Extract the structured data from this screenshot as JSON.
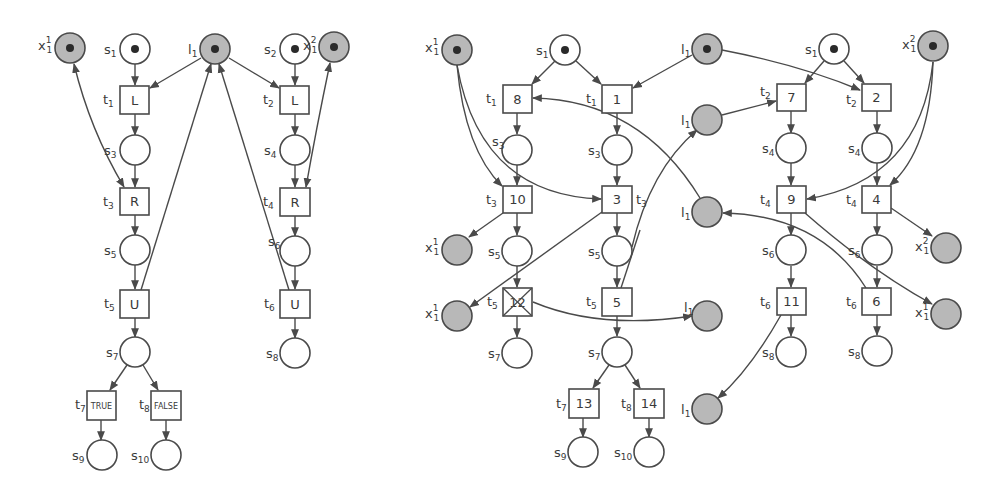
{
  "diagram": {
    "type": "petri-net-pair",
    "left_net": {
      "places": [
        {
          "id": "x1_1",
          "label": "x",
          "sup": "1",
          "sub": "1",
          "shared": true,
          "token": true
        },
        {
          "id": "s1",
          "label": "s",
          "sub": "1",
          "token": true
        },
        {
          "id": "l1",
          "label": "l",
          "sub": "1",
          "shared": true,
          "token": true
        },
        {
          "id": "s2",
          "label": "s",
          "sub": "2",
          "token": true
        },
        {
          "id": "x1_2",
          "label": "x",
          "sup": "2",
          "sub": "1",
          "shared": true,
          "token": true
        },
        {
          "id": "s3",
          "label": "s",
          "sub": "3"
        },
        {
          "id": "s4",
          "label": "s",
          "sub": "4"
        },
        {
          "id": "s5",
          "label": "s",
          "sub": "5"
        },
        {
          "id": "s6",
          "label": "s",
          "sub": "6"
        },
        {
          "id": "s7",
          "label": "s",
          "sub": "7"
        },
        {
          "id": "s8",
          "label": "s",
          "sub": "8"
        },
        {
          "id": "s9",
          "label": "s",
          "sub": "9"
        },
        {
          "id": "s10",
          "label": "s",
          "sub": "10"
        }
      ],
      "transitions": [
        {
          "id": "t1",
          "name": "t",
          "sub": "1",
          "text": "L"
        },
        {
          "id": "t2",
          "name": "t",
          "sub": "2",
          "text": "L"
        },
        {
          "id": "t3",
          "name": "t",
          "sub": "3",
          "text": "R"
        },
        {
          "id": "t4",
          "name": "t",
          "sub": "4",
          "text": "R"
        },
        {
          "id": "t5",
          "name": "t",
          "sub": "5",
          "text": "U"
        },
        {
          "id": "t6",
          "name": "t",
          "sub": "6",
          "text": "U"
        },
        {
          "id": "t7",
          "name": "t",
          "sub": "7",
          "text": "TRUE"
        },
        {
          "id": "t8",
          "name": "t",
          "sub": "8",
          "text": "FALSE"
        }
      ]
    },
    "right_net": {
      "places": [
        {
          "label": "x",
          "sup": "1",
          "sub": "1",
          "shared": true,
          "token": true
        },
        {
          "label": "s",
          "sub": "1",
          "token": true
        },
        {
          "label": "l",
          "sub": "1",
          "shared": true,
          "token": true
        },
        {
          "label": "s",
          "sub": "1",
          "token": true
        },
        {
          "label": "x",
          "sup": "2",
          "sub": "1",
          "shared": true,
          "token": true
        }
      ],
      "transitions": [
        {
          "name": "t",
          "sub": "1",
          "text": "8"
        },
        {
          "name": "t",
          "sub": "1",
          "text": "1"
        },
        {
          "name": "t",
          "sub": "2",
          "text": "7"
        },
        {
          "name": "t",
          "sub": "2",
          "text": "2"
        },
        {
          "name": "t",
          "sub": "3",
          "text": "10"
        },
        {
          "name": "t",
          "sub": "3",
          "text": "3"
        },
        {
          "name": "t",
          "sub": "4",
          "text": "9"
        },
        {
          "name": "t",
          "sub": "4",
          "text": "4"
        },
        {
          "name": "t",
          "sub": "5",
          "text": "12",
          "crossed": true
        },
        {
          "name": "t",
          "sub": "5",
          "text": "5"
        },
        {
          "name": "t",
          "sub": "6",
          "text": "11"
        },
        {
          "name": "t",
          "sub": "6",
          "text": "6"
        },
        {
          "name": "t",
          "sub": "7",
          "text": "13"
        },
        {
          "name": "t",
          "sub": "8",
          "text": "14"
        }
      ]
    },
    "colors": {
      "stroke": "#4a4a4a",
      "shared_place_fill": "#b8b8b8",
      "place_fill": "#ffffff",
      "token": "#2a2a2a"
    }
  },
  "labels": {
    "L": "L",
    "R": "R",
    "U": "U",
    "TRUE": "TRUE",
    "FALSE": "FALSE",
    "n1": "1",
    "n2": "2",
    "n3": "3",
    "n4": "4",
    "n5": "5",
    "n6": "6",
    "n7": "7",
    "n8": "8",
    "n9": "9",
    "n10": "10",
    "n11": "11",
    "n12": "12",
    "n13": "13",
    "n14": "14",
    "s": "s",
    "t": "t",
    "x": "x",
    "l": "l",
    "sub1": "1",
    "sub2": "2",
    "sub3": "3",
    "sub4": "4",
    "sub5": "5",
    "sub6": "6",
    "sub7": "7",
    "sub8": "8",
    "sub9": "9",
    "sub10": "10",
    "sup1": "1",
    "sup2": "2"
  }
}
